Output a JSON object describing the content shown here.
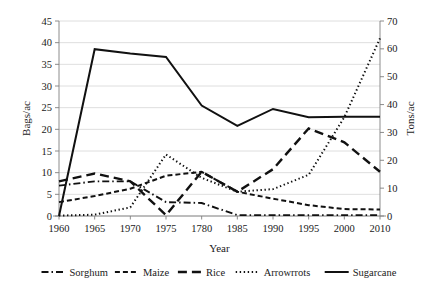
{
  "chart_data": {
    "type": "line",
    "title": "",
    "xlabel": "Year",
    "ylabel": "Bags/ac",
    "y2label": "Tons/ac",
    "grid": true,
    "legend_position": "bottom",
    "x": [
      1960,
      1965,
      1970,
      1975,
      1780,
      1985,
      1990,
      1995,
      2000,
      2010
    ],
    "xtick_labels": [
      "1960",
      "1965",
      "1970",
      "1975",
      "1780",
      "1985",
      "1990",
      "1995",
      "2000",
      "2010"
    ],
    "ylim": [
      0,
      45
    ],
    "ytick_labels": [
      "0",
      "5",
      "10",
      "15",
      "20",
      "25",
      "30",
      "35",
      "40",
      "45"
    ],
    "yticks": [
      0,
      5,
      10,
      15,
      20,
      25,
      30,
      35,
      40,
      45
    ],
    "y2lim": [
      0,
      70
    ],
    "y2tick_labels": [
      "0",
      "10",
      "20",
      "30",
      "40",
      "50",
      "60",
      "70"
    ],
    "y2ticks": [
      0,
      10,
      20,
      30,
      40,
      50,
      60,
      70
    ],
    "series": [
      {
        "name": "Sorghum",
        "axis": "left",
        "dash": "dashdot",
        "dasharray": "7,3,1.5,3",
        "width": 1.9,
        "values": [
          7.0,
          8.0,
          8.0,
          3.2,
          3.0,
          0.2,
          0.2,
          0.2,
          0.2,
          0.2
        ]
      },
      {
        "name": "Maize",
        "axis": "left",
        "dash": "dashed",
        "dasharray": "5,3",
        "width": 2.0,
        "values": [
          3.2,
          4.6,
          6.3,
          9.3,
          10.2,
          5.6,
          4.0,
          2.5,
          1.6,
          1.5
        ]
      },
      {
        "name": "Rice",
        "axis": "left",
        "dash": "longdash",
        "dasharray": "9,5",
        "width": 2.4,
        "values": [
          8.0,
          9.8,
          8.0,
          0.2,
          10.2,
          5.6,
          10.8,
          20.2,
          17.0,
          10.2
        ]
      },
      {
        "name": "Arrowrrots",
        "axis": "left",
        "dash": "dotted",
        "dasharray": "1.4,2.6",
        "width": 2.0,
        "values": [
          0.1,
          0.3,
          2.0,
          14.2,
          8.8,
          5.6,
          6.2,
          9.5,
          22.8,
          41.0
        ]
      },
      {
        "name": "Sugarcane",
        "axis": "left",
        "dash": "solid",
        "dasharray": "none",
        "width": 2.0,
        "values": [
          0.0,
          38.5,
          37.5,
          36.7,
          25.5,
          20.8,
          24.7,
          22.8,
          22.9,
          22.9
        ]
      }
    ],
    "legend": [
      {
        "label": "Sorghum",
        "dasharray": "7,3,1.5,3",
        "width": 1.9
      },
      {
        "label": "Maize",
        "dasharray": "5,3",
        "width": 2.0
      },
      {
        "label": "Rice",
        "dasharray": "9,5",
        "width": 2.4
      },
      {
        "label": "Arrowrrots",
        "dasharray": "1.4,2.6",
        "width": 2.0
      },
      {
        "label": "Sugarcane",
        "dasharray": "none",
        "width": 2.0
      }
    ],
    "colors": {
      "line": "#111111",
      "grid": "#d6d6d6",
      "axis": "#7f7f7f",
      "text": "#1a1a1a",
      "background": "#ffffff"
    }
  }
}
